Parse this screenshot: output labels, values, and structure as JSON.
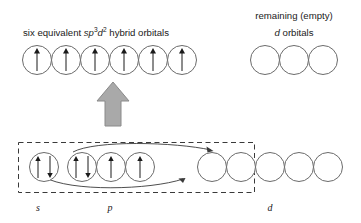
{
  "diagram": {
    "title_top_left": {
      "prefix": "six equivalent ",
      "s": "s",
      "p": "p",
      "p_sup": "3",
      "d": "d",
      "d_sup": "2",
      "suffix": " hybrid orbitals"
    },
    "title_top_right_line1": "remaining (empty)",
    "title_top_right_line2_italic": "d",
    "title_top_right_line2_rest": " orbitals",
    "subshell_labels": {
      "s": "s",
      "p": "p",
      "d": "d"
    },
    "colors": {
      "circle_stroke": "#6b6b6b",
      "electron_arrow": "#1a1a1a",
      "big_arrow_fill": "#a9a9a9",
      "big_arrow_stroke": "#8a8a8a",
      "dashed_box_stroke": "#3a3a3a",
      "curve_stroke": "#3a3a3a",
      "text": "#1a1a1a",
      "background": "#ffffff"
    },
    "hybrid_orbitals": {
      "count": 6,
      "occupancy": [
        "up",
        "up",
        "up",
        "up",
        "up",
        "up"
      ]
    },
    "remaining_d_orbitals": {
      "count": 3,
      "occupancy": [
        "empty",
        "empty",
        "empty"
      ]
    },
    "ground_state": {
      "s_orbitals": {
        "count": 1,
        "occupancy": [
          "paired"
        ]
      },
      "p_orbitals": {
        "count": 3,
        "occupancy": [
          "paired",
          "up",
          "up"
        ]
      },
      "d_orbitals": {
        "count": 5,
        "occupancy": [
          "empty",
          "empty",
          "empty",
          "empty",
          "empty"
        ]
      }
    },
    "promotion_arrows": 2,
    "hybridization_arrow": "up-block-arrow"
  }
}
